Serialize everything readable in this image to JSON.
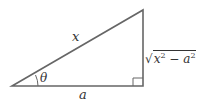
{
  "diagram": {
    "type": "right-triangle",
    "hypotenuse_label": "x",
    "angle_label": "θ",
    "adjacent_label": "a",
    "opposite_label": {
      "radicand_var1": "x",
      "exp1": "2",
      "operator": " − ",
      "radicand_var2": "a",
      "exp2": "2",
      "radical_sign": "√"
    },
    "colors": {
      "stroke": "#666666",
      "text": "#333333"
    }
  }
}
